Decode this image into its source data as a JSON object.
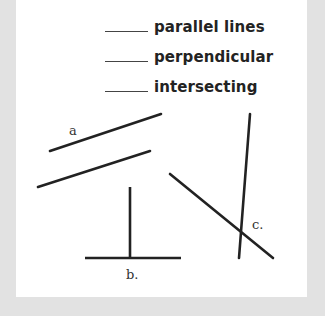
{
  "worksheet": {
    "terms": [
      {
        "blank": "",
        "label": "parallel lines"
      },
      {
        "blank": "",
        "label": "perpendicular"
      },
      {
        "blank": "",
        "label": "intersecting"
      }
    ],
    "figures": {
      "a": {
        "label": "a"
      },
      "b": {
        "label": "b."
      },
      "c": {
        "label": "c."
      }
    }
  },
  "colors": {
    "border": "#e2e2e2",
    "paper": "#ffffff",
    "ink": "#232323"
  }
}
